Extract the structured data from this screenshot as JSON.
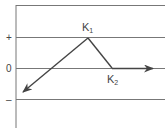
{
  "diagram": {
    "y_axis_labels": {
      "plus": "+",
      "zero": "0",
      "minus": "–"
    },
    "points": {
      "k1": {
        "label": "K",
        "sub": "1"
      },
      "k2": {
        "label": "K",
        "sub": "2"
      }
    },
    "colors": {
      "line": "#555555",
      "grid": "#777777",
      "text": "#444444"
    }
  }
}
